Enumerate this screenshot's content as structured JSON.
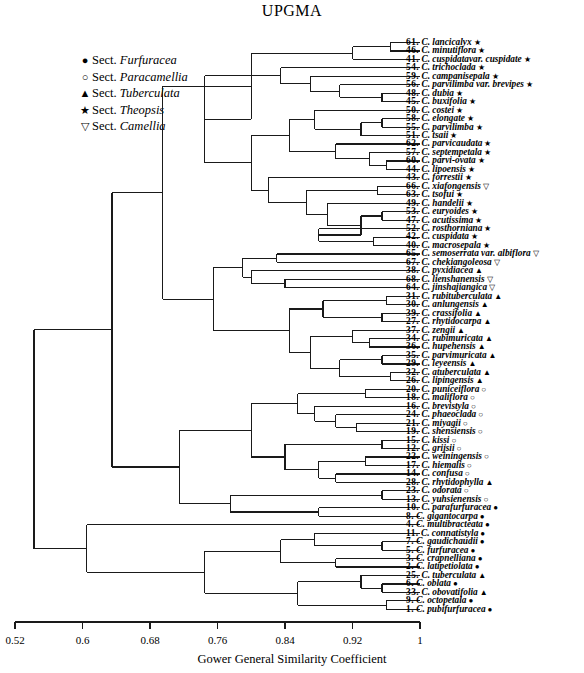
{
  "title": "UPGMA",
  "legend": {
    "items": [
      {
        "symbol": "●",
        "sect": "Sect. ",
        "name": "Furfuracea",
        "icon": "filled-circle-icon"
      },
      {
        "symbol": "○",
        "sect": "Sect. ",
        "name": "Paracamellia",
        "icon": "open-circle-icon"
      },
      {
        "symbol": "▲",
        "sect": "Sect. ",
        "name": "Tuberculata",
        "icon": "filled-triangle-icon"
      },
      {
        "symbol": "★",
        "sect": "Sect. ",
        "name": "Theopsis",
        "icon": "filled-star-icon"
      },
      {
        "symbol": "▽",
        "sect": "Sect. ",
        "name": "Camellia",
        "icon": "open-down-triangle-icon"
      }
    ]
  },
  "axis": {
    "label": "Gower General Similarity Coefficient",
    "min": 0.52,
    "max": 1,
    "ticks": [
      "0.52",
      "0.6",
      "0.68",
      "0.76",
      "0.84",
      "0.92",
      "1"
    ],
    "tick_values": [
      0.52,
      0.6,
      0.68,
      0.76,
      0.84,
      0.92,
      1
    ]
  },
  "chart_data": {
    "type": "dendrogram",
    "title": "UPGMA",
    "xlabel": "Gower General Similarity Coefficient",
    "ylabel": "",
    "xlim": [
      0.52,
      1
    ],
    "grid": false,
    "legend_position": "upper-left",
    "leaves": [
      {
        "num": "61",
        "genus": "C.",
        "species": "lancicalyx",
        "sym": "★",
        "height": 0.965
      },
      {
        "num": "46",
        "genus": "C.",
        "species": "minutiflora",
        "sym": "★",
        "height": 0.965
      },
      {
        "num": "41",
        "genus": "C.",
        "species": "cuspidatavar. cuspidate",
        "sym": "★",
        "height": 0.92
      },
      {
        "num": "54",
        "genus": "C.",
        "species": "trichoclada",
        "sym": "★",
        "height": 0.87
      },
      {
        "num": "59",
        "genus": "C.",
        "species": "campanisepala",
        "sym": "★",
        "height": 0.87
      },
      {
        "num": "56",
        "genus": "C.",
        "species": "parvilimba var. brevipes",
        "sym": "★",
        "height": 0.93
      },
      {
        "num": "48",
        "genus": "C.",
        "species": "dubia",
        "sym": "★",
        "height": 0.955
      },
      {
        "num": "45",
        "genus": "C.",
        "species": "buxifolia",
        "sym": "★",
        "height": 0.955
      },
      {
        "num": "50",
        "genus": "C.",
        "species": "costei",
        "sym": "★",
        "height": 0.9
      },
      {
        "num": "58",
        "genus": "C.",
        "species": "elongate",
        "sym": "★",
        "height": 0.955
      },
      {
        "num": "55",
        "genus": "C.",
        "species": "parvilimba",
        "sym": "★",
        "height": 0.955
      },
      {
        "num": "51",
        "genus": "C.",
        "species": "tsaii",
        "sym": "★",
        "height": 0.93
      },
      {
        "num": "62",
        "genus": "C.",
        "species": "parvicaudata",
        "sym": "★",
        "height": 0.9
      },
      {
        "num": "57",
        "genus": "C.",
        "species": "septempetala",
        "sym": "★",
        "height": 0.94
      },
      {
        "num": "60",
        "genus": "C.",
        "species": "parvi-ovata",
        "sym": "★",
        "height": 0.96
      },
      {
        "num": "44",
        "genus": "C.",
        "species": "lipoensis",
        "sym": "★",
        "height": 0.96
      },
      {
        "num": "43",
        "genus": "C.",
        "species": "forrestii",
        "sym": "★",
        "height": 0.85
      },
      {
        "num": "66",
        "genus": "C.",
        "species": "xiafongensis",
        "sym": "▽",
        "height": 0.95
      },
      {
        "num": "63",
        "genus": "C.",
        "species": "tsofui",
        "sym": "★",
        "height": 0.95
      },
      {
        "num": "49",
        "genus": "C.",
        "species": "handelii",
        "sym": "★",
        "height": 0.89
      },
      {
        "num": "53",
        "genus": "C.",
        "species": "euryoides",
        "sym": "★",
        "height": 0.955
      },
      {
        "num": "47",
        "genus": "C.",
        "species": "acutissima",
        "sym": "★",
        "height": 0.955
      },
      {
        "num": "52",
        "genus": "C.",
        "species": "rosthorniana",
        "sym": "★",
        "height": 0.88
      },
      {
        "num": "42",
        "genus": "C.",
        "species": "cuspidata",
        "sym": "★",
        "height": 0.945
      },
      {
        "num": "40",
        "genus": "C.",
        "species": "macrosepala",
        "sym": "★",
        "height": 0.945
      },
      {
        "num": "65",
        "genus": "C.",
        "species": "semoserrata var. albiflora",
        "sym": "▽",
        "height": 0.83
      },
      {
        "num": "67",
        "genus": "C.",
        "species": "chekiangoleosa",
        "sym": "▽",
        "height": 0.83
      },
      {
        "num": "38",
        "genus": "C.",
        "species": "pyxidiacea",
        "sym": "▲",
        "height": 0.8
      },
      {
        "num": "68",
        "genus": "C.",
        "species": "lienshanensis",
        "sym": "▽",
        "height": 0.8
      },
      {
        "num": "64",
        "genus": "C.",
        "species": "jinshajiangica",
        "sym": "▽",
        "height": 0.8
      },
      {
        "num": "31",
        "genus": "C.",
        "species": "rubituberculata",
        "sym": "▲",
        "height": 0.96
      },
      {
        "num": "30",
        "genus": "C.",
        "species": "anlungensis",
        "sym": "▲",
        "height": 0.96
      },
      {
        "num": "39",
        "genus": "C.",
        "species": "crassifolia",
        "sym": "▲",
        "height": 0.955
      },
      {
        "num": "27",
        "genus": "C.",
        "species": "rhytidocarpa",
        "sym": "▲",
        "height": 0.955
      },
      {
        "num": "37",
        "genus": "C.",
        "species": "zengii",
        "sym": "▲",
        "height": 0.92
      },
      {
        "num": "34",
        "genus": "C.",
        "species": "rubimuricata",
        "sym": "▲",
        "height": 0.9
      },
      {
        "num": "36",
        "genus": "C.",
        "species": "hupehensis",
        "sym": "▲",
        "height": 0.88
      },
      {
        "num": "35",
        "genus": "C.",
        "species": "parvimuricata",
        "sym": "▲",
        "height": 0.955
      },
      {
        "num": "29",
        "genus": "C.",
        "species": "leyeensis",
        "sym": "▲",
        "height": 0.955
      },
      {
        "num": "32",
        "genus": "C.",
        "species": "atuberculata",
        "sym": "▲",
        "height": 0.965
      },
      {
        "num": "26",
        "genus": "C.",
        "species": "lipingensis",
        "sym": "▲",
        "height": 0.965
      },
      {
        "num": "20",
        "genus": "C.",
        "species": "puniceiflora",
        "sym": "○",
        "height": 0.935
      },
      {
        "num": "18",
        "genus": "C.",
        "species": "maliflora",
        "sym": "○",
        "height": 0.935
      },
      {
        "num": "16",
        "genus": "C.",
        "species": "brevistyla",
        "sym": "○",
        "height": 0.86
      },
      {
        "num": "24",
        "genus": "C.",
        "species": "phaeoclada",
        "sym": "○",
        "height": 0.86
      },
      {
        "num": "21",
        "genus": "C.",
        "species": "miyagii",
        "sym": "○",
        "height": 0.86
      },
      {
        "num": "19",
        "genus": "C.",
        "species": "shensiensis",
        "sym": "○",
        "height": 0.86
      },
      {
        "num": "15",
        "genus": "C.",
        "species": "kissi",
        "sym": "○",
        "height": 0.955
      },
      {
        "num": "12",
        "genus": "C.",
        "species": "grijsii",
        "sym": "○",
        "height": 0.955
      },
      {
        "num": "22",
        "genus": "C.",
        "species": "weiningensis",
        "sym": "○",
        "height": 0.935
      },
      {
        "num": "17",
        "genus": "C.",
        "species": "hiemalis",
        "sym": "○",
        "height": 0.935
      },
      {
        "num": "14",
        "genus": "C.",
        "species": "confusa",
        "sym": "○",
        "height": 0.9
      },
      {
        "num": "28",
        "genus": "C.",
        "species": "rhytidophylla",
        "sym": "▲",
        "height": 0.9
      },
      {
        "num": "23",
        "genus": "C.",
        "species": "odorata",
        "sym": "○",
        "height": 0.955
      },
      {
        "num": "13",
        "genus": "C.",
        "species": "yuhsienensis",
        "sym": "○",
        "height": 0.955
      },
      {
        "num": "10",
        "genus": "C.",
        "species": "parafurfuracea",
        "sym": "●",
        "height": 0.88
      },
      {
        "num": "8",
        "genus": "C.",
        "species": "gigantocarpa",
        "sym": "●",
        "height": 0.75
      },
      {
        "num": "4",
        "genus": "C.",
        "species": "multibracteata",
        "sym": "●",
        "height": 0.72
      },
      {
        "num": "11",
        "genus": "C.",
        "species": "connatistyla",
        "sym": "●",
        "height": 0.93
      },
      {
        "num": "7",
        "genus": "C.",
        "species": "gaudichaudii",
        "sym": "●",
        "height": 0.955
      },
      {
        "num": "5",
        "genus": "C.",
        "species": "furfuracea",
        "sym": "●",
        "height": 0.955
      },
      {
        "num": "3",
        "genus": "C.",
        "species": "crapnelliana",
        "sym": "●",
        "height": 0.9
      },
      {
        "num": "2",
        "genus": "C.",
        "species": "latipetiolata",
        "sym": "●",
        "height": 0.9
      },
      {
        "num": "25",
        "genus": "C.",
        "species": "tuberculata",
        "sym": "▲",
        "height": 0.93
      },
      {
        "num": "6",
        "genus": "C.",
        "species": "oblata",
        "sym": "●",
        "height": 0.955
      },
      {
        "num": "33",
        "genus": "C.",
        "species": "obovatifolia",
        "sym": "▲",
        "height": 0.955
      },
      {
        "num": "9",
        "genus": "C.",
        "species": "octopetala",
        "sym": "●",
        "height": 0.96
      },
      {
        "num": "1",
        "genus": "C.",
        "species": "pubifurfuracea",
        "sym": "●",
        "height": 0.96
      }
    ],
    "root_height": 0.5425
  }
}
